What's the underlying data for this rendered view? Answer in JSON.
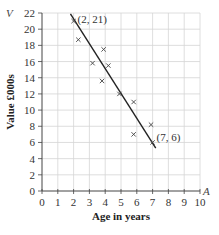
{
  "chart_data": {
    "type": "scatter",
    "title": "",
    "xlabel": "Age in years",
    "ylabel": "Value £000s",
    "x_var": "A",
    "y_var": "V",
    "xlim": [
      0,
      10
    ],
    "ylim": [
      0,
      22
    ],
    "x_ticks": [
      "0",
      "1",
      "2",
      "3",
      "4",
      "5",
      "6",
      "7",
      "8",
      "9",
      "10"
    ],
    "y_ticks": [
      "0",
      "2",
      "4",
      "6",
      "8",
      "10",
      "12",
      "14",
      "16",
      "18",
      "20",
      "22"
    ],
    "grid": true,
    "series": [
      {
        "name": "data",
        "marker": "x",
        "points": [
          {
            "x": 2.0,
            "y": 21.0
          },
          {
            "x": 2.3,
            "y": 18.7
          },
          {
            "x": 3.2,
            "y": 15.8
          },
          {
            "x": 3.9,
            "y": 17.5
          },
          {
            "x": 4.2,
            "y": 15.5
          },
          {
            "x": 3.8,
            "y": 13.6
          },
          {
            "x": 4.9,
            "y": 12.0
          },
          {
            "x": 5.8,
            "y": 11.0
          },
          {
            "x": 5.8,
            "y": 7.0
          },
          {
            "x": 6.9,
            "y": 8.2
          },
          {
            "x": 7.0,
            "y": 6.0
          }
        ]
      }
    ],
    "line_of_best_fit": {
      "from": {
        "x": 1.8,
        "y": 21.9
      },
      "to": {
        "x": 7.2,
        "y": 5.3
      }
    },
    "annotations": [
      {
        "text": "(2, 21)",
        "x": 2,
        "y": 21
      },
      {
        "text": "(7, 6)",
        "x": 7,
        "y": 6
      }
    ]
  }
}
